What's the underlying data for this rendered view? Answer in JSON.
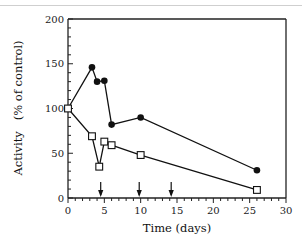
{
  "chart_data": {
    "type": "line",
    "title": "",
    "xlabel": "Time (days)",
    "ylabel": "Activity   (% of control)",
    "xlim": [
      0,
      30
    ],
    "ylim": [
      0,
      200
    ],
    "xticks": [
      0,
      5,
      10,
      15,
      20,
      25,
      30
    ],
    "yticks": [
      0,
      50,
      100,
      150,
      200
    ],
    "xtick_labels": [
      "0",
      "5",
      "10",
      "15",
      "20",
      "25",
      "30"
    ],
    "ytick_labels": [
      "0",
      "50",
      "100",
      "150",
      "200"
    ],
    "grid": false,
    "legend": null,
    "series": [
      {
        "name": "filled circles",
        "marker": "filled-circle",
        "color": "#111111",
        "x": [
          0,
          3.3,
          4,
          5,
          6,
          10,
          26
        ],
        "y": [
          100,
          146,
          130,
          131,
          82,
          90,
          31
        ]
      },
      {
        "name": "open squares",
        "marker": "open-square",
        "color": "#111111",
        "x": [
          0,
          3.3,
          4.3,
          5,
          6,
          10,
          26
        ],
        "y": [
          100,
          69,
          35,
          63,
          59,
          48,
          9
        ]
      }
    ],
    "annotations": [
      {
        "type": "arrow-down",
        "x": 4.5
      },
      {
        "type": "arrow-down",
        "x": 9.8
      },
      {
        "type": "arrow-down",
        "x": 14.2
      }
    ]
  }
}
